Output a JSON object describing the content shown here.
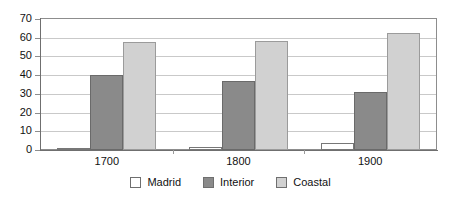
{
  "chart_data": {
    "type": "bar",
    "title": "",
    "subtitle": "",
    "xlabel": "",
    "ylabel": "",
    "categories": [
      "1700",
      "1800",
      "1900"
    ],
    "series": [
      {
        "name": "Madrid",
        "color": "#ffffff",
        "values": [
          1,
          1.5,
          3.5
        ]
      },
      {
        "name": "Interior",
        "color": "#8a8a8a",
        "values": [
          40,
          37,
          31
        ]
      },
      {
        "name": "Coastal",
        "color": "#d1d1d1",
        "values": [
          57.5,
          58.5,
          62.5
        ]
      }
    ],
    "ylim": [
      0,
      70
    ],
    "yticks": [
      0,
      10,
      20,
      30,
      40,
      50,
      60,
      70
    ],
    "ytick_labels": [
      "0",
      "10",
      "20",
      "30",
      "40",
      "50",
      "60",
      "70"
    ],
    "grid": true,
    "grid_axis": "y",
    "legend_position": "bottom",
    "legend_entries": [
      "Madrid",
      "Interior",
      "Coastal"
    ],
    "annotations": []
  },
  "colors": {
    "background": "#ffffff",
    "plot_border": "#8d8d8d",
    "gridline": "#c9c9c9",
    "axis": "#6f6f6f",
    "text": "#111111",
    "madrid": "#ffffff",
    "interior": "#8a8a8a",
    "coastal": "#d1d1d1"
  }
}
